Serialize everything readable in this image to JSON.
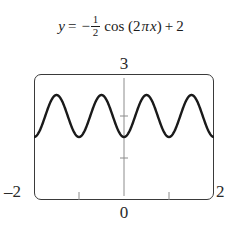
{
  "equation": {
    "lhs": "y",
    "equals": "=",
    "minus": "−",
    "frac_num": "1",
    "frac_den": "2",
    "fn": "cos",
    "open_paren": "(",
    "coef": "2",
    "pi": "π",
    "x": "x",
    "close_paren": ")",
    "plus": "+",
    "constant": "2",
    "plain": "y = -1/2 cos (2πx) + 2"
  },
  "labels": {
    "y_max": "3",
    "x_min": "–2",
    "x_max": "2",
    "x_zero": "0"
  },
  "colors": {
    "curve": "#1a1a1a",
    "frame": "#3a3a3a",
    "axis": "#8c8c8c",
    "text": "#1b1b1b",
    "background": "#ffffff"
  },
  "chart_data": {
    "type": "line",
    "xlabel": "",
    "ylabel": "",
    "xlim": [
      -2,
      2
    ],
    "ylim": [
      0,
      3
    ],
    "grid": false,
    "legend": "none",
    "xticks": [
      -2,
      -1,
      0,
      1,
      2
    ],
    "xtick_labels": [
      "–2",
      "",
      "0",
      "",
      "2"
    ],
    "yticks": [
      0,
      1,
      2,
      3
    ],
    "ytick_labels": [
      "",
      "",
      "",
      "3"
    ],
    "axes_shown": {
      "y_axis_at_x": 0,
      "x_axis_at_y": 0
    },
    "function": {
      "expression": "-0.5*cos(2*pi*x) + 2",
      "amplitude": 0.5,
      "period": 1,
      "vertical_shift": 2,
      "reflected": true
    },
    "series": [
      {
        "name": "y = -1/2 cos (2πx) + 2",
        "x": [
          -2,
          -1.9,
          -1.8,
          -1.7,
          -1.6,
          -1.5,
          -1.4,
          -1.3,
          -1.2,
          -1.1,
          -1,
          -0.9,
          -0.8,
          -0.7,
          -0.6,
          -0.5,
          -0.4,
          -0.3,
          -0.2,
          -0.1,
          0,
          0.1,
          0.2,
          0.3,
          0.4,
          0.5,
          0.6,
          0.7,
          0.8,
          0.9,
          1,
          1.1,
          1.2,
          1.3,
          1.4,
          1.5,
          1.6,
          1.7,
          1.8,
          1.9,
          2
        ],
        "y": [
          1.5,
          1.595,
          1.845,
          2.155,
          2.405,
          2.5,
          2.405,
          2.155,
          1.845,
          1.595,
          1.5,
          1.595,
          1.845,
          2.155,
          2.405,
          2.5,
          2.405,
          2.155,
          1.845,
          1.595,
          1.5,
          1.595,
          1.845,
          2.155,
          2.405,
          2.5,
          2.405,
          2.155,
          1.845,
          1.595,
          1.5,
          1.595,
          1.845,
          2.155,
          2.405,
          2.5,
          2.405,
          2.155,
          1.845,
          1.595,
          1.5
        ]
      }
    ],
    "maxima": [
      {
        "x": -1.5,
        "y": 2.5
      },
      {
        "x": -0.5,
        "y": 2.5
      },
      {
        "x": 0.5,
        "y": 2.5
      },
      {
        "x": 1.5,
        "y": 2.5
      }
    ],
    "minima": [
      {
        "x": -2,
        "y": 1.5
      },
      {
        "x": -1,
        "y": 1.5
      },
      {
        "x": 0,
        "y": 1.5
      },
      {
        "x": 1,
        "y": 1.5
      },
      {
        "x": 2,
        "y": 1.5
      }
    ]
  }
}
